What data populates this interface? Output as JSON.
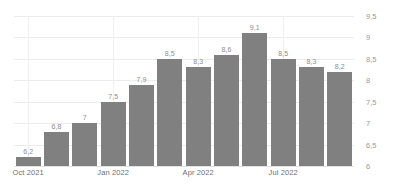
{
  "chart_data": {
    "type": "bar",
    "title": "",
    "subtitle": "",
    "xlabel": "",
    "ylabel": "",
    "grid": true,
    "legend": "none",
    "y_axis_position": "right",
    "ylim": [
      6,
      9.5
    ],
    "yticks": [
      "6",
      "6.5",
      "7",
      "7.5",
      "8",
      "8.5",
      "9",
      "9.5"
    ],
    "ytick_values": [
      6,
      6.5,
      7,
      7.5,
      8,
      8.5,
      9,
      9.5
    ],
    "categories": [
      "Oct 2021",
      "Nov 2021",
      "Dec 2021",
      "Jan 2022",
      "Feb 2022",
      "Mar 2022",
      "Apr 2022",
      "May 2022",
      "Jun 2022",
      "Jul 2022",
      "Aug 2022",
      "Sep 2022"
    ],
    "xtick_labels": [
      "Oct 2021",
      "Jan 2022",
      "Apr 2022",
      "Jul 2022"
    ],
    "xtick_indices": [
      0,
      3,
      6,
      9
    ],
    "values": [
      6.2,
      6.8,
      7,
      7.5,
      7.9,
      8.5,
      8.3,
      8.6,
      9.1,
      8.5,
      8.3,
      8.2
    ],
    "data_labels": [
      "6,2",
      "6,8",
      "7",
      "7,5",
      "7,9",
      "8,5",
      "8,3",
      "8,6",
      "9,1",
      "8,5",
      "8,3",
      "8,2"
    ],
    "bar_color": "#808080",
    "grid_color": "#ececec",
    "label_color": "#8d8d8d",
    "axis_text_color": "#9a9a9a",
    "background_color": "#ffffff"
  }
}
